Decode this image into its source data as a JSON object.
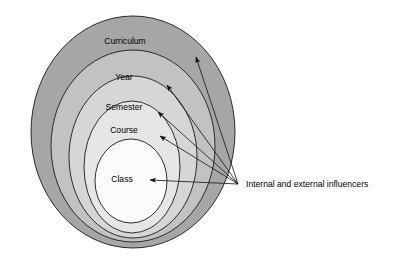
{
  "figure": {
    "type": "concentric-circles-diagram",
    "title": "",
    "background_color": "#ffffff",
    "outline_color": "#1a1a1a",
    "rings": [
      {
        "label": "Curriculum",
        "level": 1,
        "fill_color": "#a6a6a6",
        "cx": 133,
        "cy": 132,
        "rx": 102,
        "ry": 116,
        "label_x": 125,
        "label_y": 42
      },
      {
        "label": "Year",
        "level": 2,
        "fill_color": "#c2c2c2",
        "cx": 133,
        "cy": 146,
        "rx": 82,
        "ry": 96,
        "label_x": 124,
        "label_y": 78
      },
      {
        "label": "Semester",
        "level": 3,
        "fill_color": "#d6d6d6",
        "cx": 133,
        "cy": 157,
        "rx": 64,
        "ry": 81,
        "label_x": 124,
        "label_y": 108
      },
      {
        "label": "Course",
        "level": 4,
        "fill_color": "#e6e6e6",
        "cx": 132,
        "cy": 167,
        "rx": 48,
        "ry": 66,
        "label_x": 124,
        "label_y": 131
      },
      {
        "label": "Class",
        "level": 5,
        "fill_color": "#fbfbfb",
        "cx": 131,
        "cy": 181,
        "rx": 36,
        "ry": 42,
        "label_x": 122,
        "label_y": 180
      }
    ],
    "callout": {
      "label": "Internal and external influencers",
      "label_x": 246,
      "label_y": 185,
      "origin_x": 238,
      "origin_y": 184,
      "arrows": [
        {
          "target_label": "Curriculum",
          "tip_x": 196,
          "tip_y": 57
        },
        {
          "target_label": "Year",
          "tip_x": 167,
          "tip_y": 85
        },
        {
          "target_label": "Semester",
          "tip_x": 158,
          "tip_y": 112
        },
        {
          "target_label": "Course",
          "tip_x": 160,
          "tip_y": 136
        },
        {
          "target_label": "Class",
          "tip_x": 150,
          "tip_y": 180
        }
      ]
    }
  }
}
